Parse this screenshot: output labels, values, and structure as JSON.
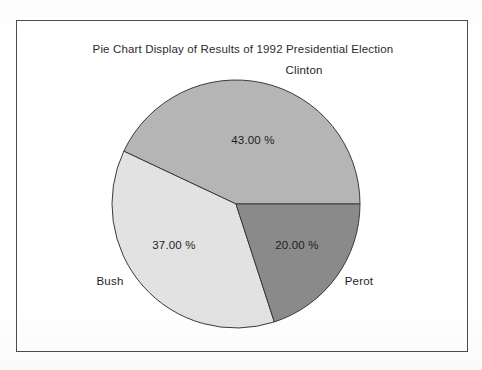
{
  "figure": {
    "title": "Pie Chart Display of Results of 1992 Presidential Election",
    "frame_color": "#4c4c4c",
    "background": "#ffffff"
  },
  "chart_data": {
    "type": "pie",
    "title": "Pie Chart Display of Results of 1992 Presidential Election",
    "xlabel": "",
    "ylabel": "",
    "legend_position": "none",
    "grid": false,
    "value_suffix": " %",
    "categories": [
      "Clinton",
      "Bush",
      "Perot"
    ],
    "values": [
      43.0,
      37.0,
      20.0
    ],
    "labels": [
      "43.00 %",
      "37.00 %",
      "20.00 %"
    ],
    "colors": [
      "#b5b5b5",
      "#e2e2e2",
      "#8a8a8a"
    ],
    "slices": [
      {
        "name": "Clinton",
        "value": 43.0,
        "label": "43.00 %",
        "color": "#b5b5b5",
        "outside_label_pos": "top",
        "label_x": 304,
        "label_y": 74,
        "pct_x": 253,
        "pct_y": 144
      },
      {
        "name": "Bush",
        "value": 37.0,
        "label": "37.00 %",
        "color": "#e2e2e2",
        "outside_label_pos": "bottom-left",
        "label_x": 110,
        "label_y": 285,
        "pct_x": 174,
        "pct_y": 249
      },
      {
        "name": "Perot",
        "value": 20.0,
        "label": "20.00 %",
        "color": "#8a8a8a",
        "outside_label_pos": "bottom-right",
        "label_x": 359,
        "label_y": 285,
        "pct_x": 297,
        "pct_y": 249
      }
    ],
    "geometry": {
      "center_x": 236,
      "center_y": 204,
      "radius": 124,
      "start_angle_deg": 0,
      "direction": "counterclockwise"
    }
  }
}
